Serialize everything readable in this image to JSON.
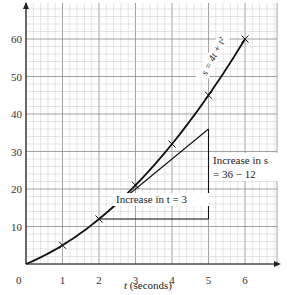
{
  "chart_data": {
    "type": "line",
    "title": "",
    "xlabel": "t (seconds)",
    "ylabel": "s",
    "xlim": [
      0,
      6.9
    ],
    "ylim": [
      0,
      70
    ],
    "grid": true,
    "x_ticks": [
      0,
      1,
      2,
      3,
      4,
      5,
      6
    ],
    "y_ticks": [
      10,
      20,
      30,
      40,
      50,
      60
    ],
    "series": [
      {
        "name": "s = 4t + t²",
        "equation": "s = 4t + t^2",
        "x": [
          0,
          1,
          2,
          3,
          4,
          5,
          6
        ],
        "values": [
          0,
          5,
          12,
          21,
          32,
          45,
          60
        ],
        "markers": [
          1,
          2,
          3,
          4,
          5,
          6
        ]
      },
      {
        "name": "tangent at t = 3",
        "x": [
          2,
          5
        ],
        "values": [
          12,
          36
        ]
      }
    ],
    "annotations": [
      {
        "text": "Increase in t = 3",
        "from": [
          2,
          12
        ],
        "to": [
          5,
          12
        ]
      },
      {
        "text_line1": "Increase in s",
        "text_line2": "= 36 − 12",
        "from": [
          5,
          12
        ],
        "to": [
          5,
          36
        ]
      }
    ]
  },
  "labels": {
    "origin": "0",
    "x_axis_title_var": "t",
    "x_axis_title_unit": " (seconds)",
    "curve_label": "s = 4t + t²",
    "increase_t": "Increase in t = 3",
    "increase_s_line1": "Increase in s",
    "increase_s_line2": "= 36 − 12"
  },
  "colors": {
    "grid_minor": "#c8c8c8",
    "grid_major": "#8a8a8a",
    "axis": "#222222",
    "curve": "#111111"
  }
}
